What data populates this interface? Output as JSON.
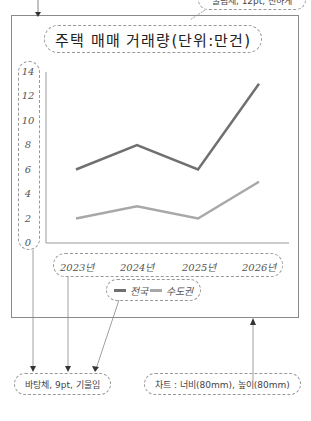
{
  "annotations": {
    "title_font_note": "굴림체, 12pt, 진하게",
    "axis_font_note": "바탕체, 9pt, 기울임",
    "chart_size_note": "차트 : 너비(80mm), 높이(80mm)"
  },
  "chart_data": {
    "type": "line",
    "title": "주택 매매 거래량(단위:만건)",
    "categories": [
      "2023년",
      "2024년",
      "2025년",
      "2026년"
    ],
    "series": [
      {
        "name": "전국",
        "color": "#707070",
        "values": [
          6,
          8,
          6,
          13
        ]
      },
      {
        "name": "수도권",
        "color": "#a8a8a8",
        "values": [
          2,
          3,
          2,
          5
        ]
      }
    ],
    "y_ticks": [
      "14",
      "12",
      "10",
      "8",
      "6",
      "4",
      "2",
      "0"
    ],
    "ylim": [
      0,
      14
    ],
    "xlabel": "",
    "ylabel": "",
    "grid": false,
    "legend_position": "bottom"
  }
}
